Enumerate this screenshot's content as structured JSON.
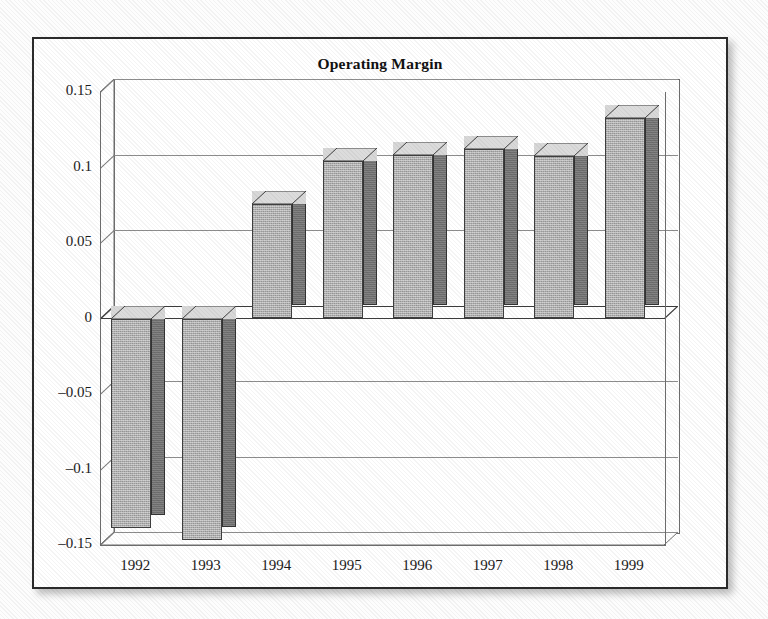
{
  "chart_data": {
    "type": "bar",
    "title": "Operating Margin",
    "xlabel": "",
    "ylabel": "",
    "categories": [
      "1992",
      "1993",
      "1994",
      "1995",
      "1996",
      "1997",
      "1998",
      "1999"
    ],
    "values": [
      -0.139,
      -0.147,
      0.0755,
      0.1045,
      0.108,
      0.112,
      0.1075,
      0.1325
    ],
    "series": [
      {
        "name": "Operating Margin",
        "values": [
          -0.139,
          -0.147,
          0.0755,
          0.1045,
          0.108,
          0.112,
          0.1075,
          0.1325
        ]
      }
    ],
    "ylim": [
      -0.15,
      0.15
    ],
    "yticks": [
      0.15,
      0.1,
      0.05,
      0,
      -0.05,
      -0.1,
      -0.15
    ],
    "ytick_labels": [
      "0.15",
      "0.1",
      "0.05",
      "0",
      "–0.05",
      "–0.1",
      "–0.15"
    ],
    "grid": true,
    "legend": "none",
    "style": "3d-column",
    "colors": {
      "bar_front": "#b0b0b0",
      "bar_side": "#6d6d6d",
      "bar_top": "#d8d8d8",
      "gridline": "#8d8d8d",
      "axis": "#3d3d3d",
      "frame": "#2b2b2b",
      "background": "#ffffff",
      "text": "#1a1a1a"
    }
  }
}
